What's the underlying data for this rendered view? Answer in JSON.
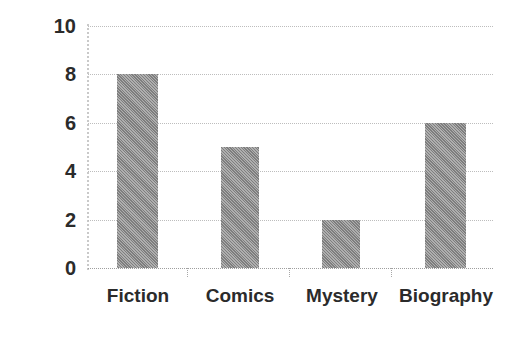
{
  "chart_data": {
    "type": "bar",
    "title": "",
    "subtitle": "",
    "xlabel": "",
    "ylabel": "",
    "categories": [
      "Fiction",
      "Comics",
      "Mystery",
      "Biography"
    ],
    "values": [
      8,
      5,
      2,
      6
    ],
    "ylim": [
      0,
      10
    ],
    "y_ticks": [
      10,
      8,
      6,
      4,
      2,
      0
    ],
    "y_tick_labels": [
      "10",
      "8",
      "6",
      "4",
      "2",
      "0"
    ],
    "grid": true,
    "grid_axis": "y",
    "legend": false,
    "legend_position": "none",
    "annotations": [],
    "colors": {
      "bar_fill": "#8c8c8c",
      "gridline": "#bdbdbd",
      "axis_line": "#c9c9c9",
      "text": "#2b2b2b",
      "background": "#ffffff"
    }
  }
}
